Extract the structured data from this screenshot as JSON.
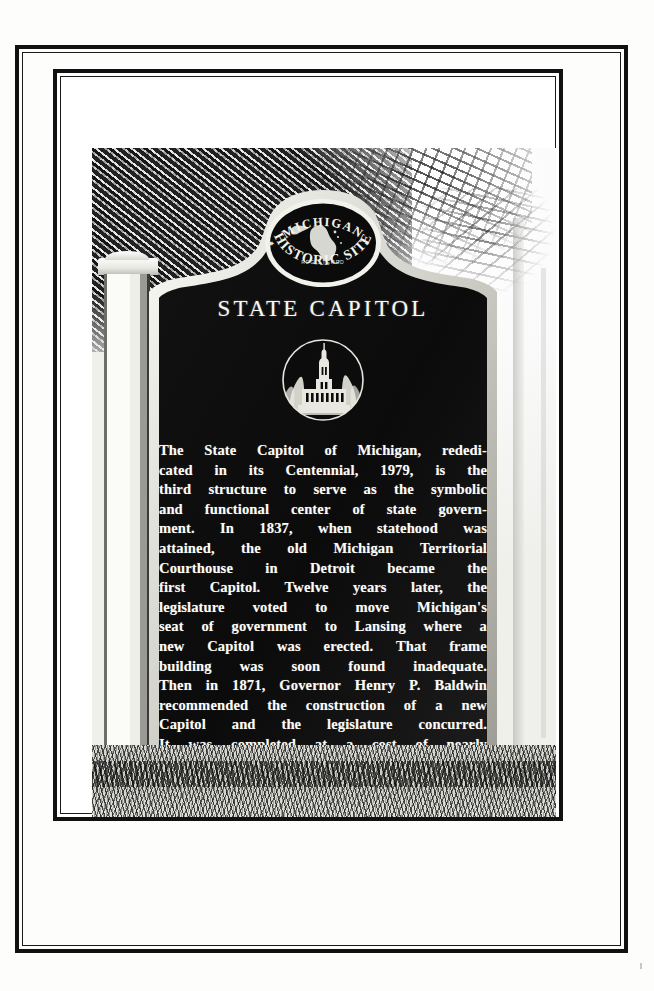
{
  "page": {
    "kind": "scanned-photograph-plate",
    "background_color": "#fdfdfc",
    "rule_color": "#111111"
  },
  "marker": {
    "seal": {
      "top_arc_text": "MICHIGAN",
      "bottom_arc_text": "HISTORIC SITE",
      "center_text": "REGISTERED",
      "emblem_name": "michigan-state-outline"
    },
    "title": "STATE CAPITOL",
    "emblem": {
      "name": "capitol-building-medallion",
      "description": "Capitol building with dome and tower flanked by trees"
    },
    "body_lines": [
      "The State Capitol of Michigan, rededi-",
      "cated in its Centennial, 1979, is the",
      "third structure to serve as the symbolic",
      "and functional center of state govern-",
      "ment.  In 1837, when statehood was",
      "attained, the old Michigan Territorial",
      "Courthouse in Detroit became the",
      "first Capitol.  Twelve years later, the",
      "legislature voted to move Michigan's",
      "seat of government to Lansing where a",
      "new Capitol was erected.  That frame",
      "building was soon found inadequate.",
      "Then in 1871, Governor Henry P. Baldwin",
      "recommended the construction of a new",
      "Capitol and the legislature concurred.",
      "It was completed at a cost of nearly",
      "$1,500,000."
    ],
    "body_text": "The State Capitol of Michigan, rededicated in its Centennial, 1979, is the third structure to serve as the symbolic and functional center of state government. In 1837, when statehood was attained, the old Michigan Territorial Courthouse in Detroit became the first Capitol. Twelve years later, the legislature voted to move Michigan's seat of government to Lansing where a new Capitol was erected. That frame building was soon found inadequate. Then in 1871, Governor Henry P. Baldwin recommended the construction of a new Capitol and the legislature concurred. It was completed at a cost of nearly $1,500,000.",
    "fineprint": [
      "MICHIGAN HISTORY DIVISION, DEPARTMENT OF STATE",
      "REGISTERED HISTORIC BUILDING NO. 1",
      "PROPERTY OF THE STATE OF MICHIGAN, 1980"
    ],
    "colors": {
      "face": "#0d0d0d",
      "rim": "#e8e8e2",
      "text": "#f7f7f3"
    }
  },
  "scene": {
    "post_name": "stone-post",
    "ground_name": "grass-foreground",
    "foliage_name": "tree-foliage"
  }
}
